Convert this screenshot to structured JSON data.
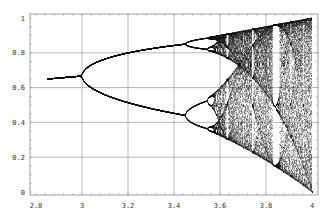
{
  "chart_data": {
    "type": "scatter",
    "title": "",
    "subtitle": "Bifurcation diagram of the logistic map x(n+1) = r·x(n)·(1−x(n))",
    "xlabel": "",
    "ylabel": "",
    "xlim": [
      2.8,
      4.0
    ],
    "ylim": [
      0,
      1
    ],
    "grid": true,
    "legend": null,
    "x_ticks": [
      2.8,
      3.0,
      3.2,
      3.4,
      3.6,
      3.8,
      4.0
    ],
    "x_tick_labels": [
      "2.8",
      "3",
      "3.2",
      "3.4",
      "3.6",
      "3.8",
      "4"
    ],
    "y_ticks": [
      0,
      0.2,
      0.4,
      0.6,
      0.8,
      1.0
    ],
    "y_tick_labels": [
      "0",
      "0.2",
      "0.4",
      "0.6",
      "0.8",
      "1"
    ],
    "x_grid": [
      3.0,
      3.2,
      3.4,
      3.6,
      3.8
    ],
    "y_grid": [
      0.2,
      0.4,
      0.6,
      0.8
    ],
    "series": [
      {
        "name": "attractor points",
        "r_range": [
          2.85,
          4.0
        ],
        "sample_points": [
          {
            "r": 2.85,
            "x": [
              0.649
            ]
          },
          {
            "r": 3.0,
            "x": [
              0.667
            ]
          },
          {
            "r": 3.2,
            "x": [
              0.513,
              0.799
            ]
          },
          {
            "r": 3.4,
            "x": [
              0.452,
              0.842
            ]
          },
          {
            "r": 3.5,
            "x": [
              0.383,
              0.501,
              0.827,
              0.875
            ]
          },
          {
            "r": 3.57,
            "x_range": [
              0.34,
              0.89
            ]
          },
          {
            "r": 3.83,
            "x": [
              0.156,
              0.505,
              0.957
            ]
          },
          {
            "r": 4.0,
            "x_range": [
              0.0,
              1.0
            ]
          }
        ]
      }
    ],
    "annotations": [
      "period-3 window near r≈3.83",
      "periodic windows near r≈3.63 and r≈3.74"
    ]
  },
  "axes": {
    "x_labels": [
      "2.8",
      "3",
      "3.2",
      "3.4",
      "3.6",
      "3.8",
      "4"
    ],
    "y_labels": [
      "0",
      "0.2",
      "0.4",
      "0.6",
      "0.8",
      "1"
    ]
  }
}
